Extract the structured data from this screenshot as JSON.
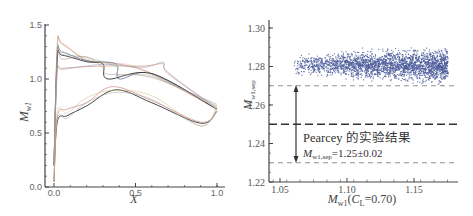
{
  "chart_data": [
    {
      "type": "line",
      "title": "",
      "xlabel": "X",
      "ylabel": "M_w1",
      "xlim": [
        0.0,
        1.0
      ],
      "ylim": [
        0.0,
        1.5
      ],
      "x_ticks": [
        "0.0",
        "0.5",
        "1.0"
      ],
      "y_ticks": [
        "0.0",
        "0.5",
        "1.0",
        "1.5"
      ],
      "grid": false,
      "series_description": "Multiple wall Mach number distributions (upper and lower surface) for sampled cases; upper surface peaks ~1.1-1.33 near leading edge with shocks between X≈0.25-0.7; lower surface rises to ~0.9 at X≈0.38 then falls to ~0.6 near X≈0.9, both converging to ~0.72 at X=1.0",
      "series": [
        {
          "name": "upper-1",
          "color": "#d9a0a0",
          "x": [
            0.0,
            0.02,
            0.05,
            0.2,
            0.35,
            0.45,
            0.6,
            1.0
          ],
          "y": [
            0.2,
            1.3,
            1.33,
            1.17,
            1.15,
            1.12,
            1.05,
            0.72
          ]
        },
        {
          "name": "upper-2",
          "color": "#7080b0",
          "x": [
            0.0,
            0.02,
            0.05,
            0.2,
            0.38,
            0.4,
            0.6,
            1.0
          ],
          "y": [
            0.2,
            1.22,
            1.25,
            1.17,
            1.14,
            1.0,
            1.05,
            0.72
          ]
        },
        {
          "name": "upper-3",
          "color": "#333333",
          "x": [
            0.0,
            0.02,
            0.05,
            0.2,
            0.3,
            0.33,
            0.6,
            1.0
          ],
          "y": [
            0.2,
            1.18,
            1.22,
            1.16,
            1.14,
            1.0,
            1.05,
            0.72
          ]
        },
        {
          "name": "upper-4",
          "color": "#e0b090",
          "x": [
            0.0,
            0.02,
            0.05,
            0.3,
            0.55,
            0.67,
            0.7,
            1.0
          ],
          "y": [
            0.2,
            1.08,
            1.1,
            1.12,
            1.12,
            1.14,
            1.06,
            0.72
          ]
        },
        {
          "name": "lower-1",
          "color": "#333333",
          "x": [
            0.0,
            0.02,
            0.08,
            0.2,
            0.38,
            0.6,
            0.9,
            1.0
          ],
          "y": [
            0.05,
            0.6,
            0.66,
            0.75,
            0.9,
            0.78,
            0.59,
            0.7
          ]
        },
        {
          "name": "lower-2",
          "color": "#d9a0a0",
          "x": [
            0.0,
            0.02,
            0.08,
            0.2,
            0.36,
            0.6,
            0.9,
            1.0
          ],
          "y": [
            0.05,
            0.65,
            0.72,
            0.78,
            0.93,
            0.8,
            0.6,
            0.7
          ]
        }
      ]
    },
    {
      "type": "scatter",
      "title": "",
      "xlabel": "M_w1(C_L=0.70)",
      "ylabel": "M_w1,sep",
      "xlim": [
        1.04,
        1.18
      ],
      "ylim": [
        1.22,
        1.3
      ],
      "x_ticks": [
        "1.05",
        "1.10",
        "1.15"
      ],
      "y_ticks": [
        "1.22",
        "1.24",
        "1.26",
        "1.28",
        "1.30"
      ],
      "grid": false,
      "point_color": "#4a5a9a",
      "cloud": {
        "x_range": [
          1.06,
          1.175
        ],
        "y_center": 1.281,
        "y_range": [
          1.272,
          1.288
        ],
        "density_peak_x": 1.14
      },
      "reference_lines": [
        {
          "y": 1.27,
          "style": "dashed-thin",
          "label": "upper bound"
        },
        {
          "y": 1.25,
          "style": "dashed-thick",
          "label": "mean"
        },
        {
          "y": 1.23,
          "style": "dashed-thin",
          "label": "lower bound"
        }
      ],
      "annotations": [
        {
          "text": "Pearcey 的实验结果",
          "x": 1.065,
          "y": 1.243
        },
        {
          "text": "M_w1,sep=1.25±0.02",
          "x": 1.065,
          "y": 1.235
        },
        {
          "type": "double-arrow",
          "x": 1.06,
          "y_from": 1.23,
          "y_to": 1.27
        }
      ]
    }
  ],
  "left": {
    "xlabel": "X",
    "ylabel_main": "M",
    "ylabel_sub": "w1",
    "xticks": [
      {
        "v": 0.0,
        "t": "0.0"
      },
      {
        "v": 0.5,
        "t": "0.5"
      },
      {
        "v": 1.0,
        "t": "1.0"
      }
    ],
    "yticks": [
      {
        "v": 0.0,
        "t": "0.0"
      },
      {
        "v": 0.5,
        "t": "0.5"
      },
      {
        "v": 1.0,
        "t": "1.0"
      },
      {
        "v": 1.5,
        "t": "1.5"
      }
    ]
  },
  "right": {
    "xlabel_main": "M",
    "xlabel_sub": "w1",
    "xlabel_rest1": "(",
    "xlabel_cl": "C",
    "xlabel_cl_sub": "L",
    "xlabel_rest2": "=0.70)",
    "ylabel_main": "M",
    "ylabel_sub": "w1,sep",
    "xticks": [
      {
        "v": 1.05,
        "t": "1.05"
      },
      {
        "v": 1.1,
        "t": "1.10"
      },
      {
        "v": 1.15,
        "t": "1.15"
      }
    ],
    "yticks": [
      {
        "v": 1.22,
        "t": "1.22"
      },
      {
        "v": 1.24,
        "t": "1.24"
      },
      {
        "v": 1.26,
        "t": "1.26"
      },
      {
        "v": 1.28,
        "t": "1.28"
      },
      {
        "v": 1.3,
        "t": "1.30"
      }
    ],
    "annotation_title": "Pearcey 的实验结果",
    "annotation_formula_main": "M",
    "annotation_formula_sub": "w1,sep",
    "annotation_formula_rest": "=1.25±0.02"
  }
}
